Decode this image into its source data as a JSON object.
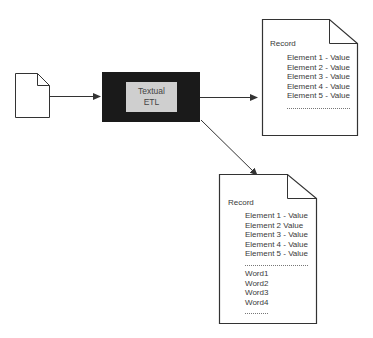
{
  "diagram": {
    "source_document": {
      "label": ""
    },
    "process": {
      "lines": [
        "Textual",
        "ETL"
      ]
    },
    "output_record_1": {
      "title": "Record",
      "elements": [
        "Element 1 - Value",
        "Element 2 - Value",
        "Element 3 - Value",
        "Element 4 - Value",
        "Element 5 - Value"
      ],
      "ellipsis": "........................"
    },
    "output_record_2": {
      "title": "Record",
      "elements": [
        "Element 1 - Value",
        "Element 2   Value",
        "Element 3 - Value",
        "Element 4 - Value",
        "Element 5 - Value"
      ],
      "ellipsis": "........................",
      "words": [
        "Word1",
        "Word2",
        "Word3",
        "Word4"
      ],
      "words_ellipsis": "........."
    },
    "colors": {
      "process_box": "#1a1a1a",
      "process_inner": "#cfcfcf",
      "stroke": "#333333"
    }
  }
}
